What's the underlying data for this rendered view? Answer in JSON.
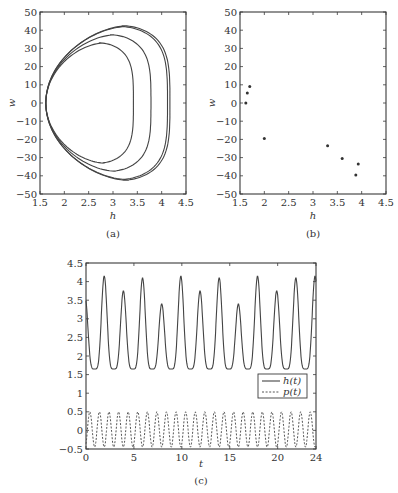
{
  "chart_data": [
    {
      "id": "a",
      "type": "line",
      "title": "",
      "caption": "(a)",
      "xlabel": "h",
      "ylabel": "w",
      "xlim": [
        1.5,
        4.5
      ],
      "ylim": [
        -50,
        50
      ],
      "xticks": [
        "1.5",
        "2",
        "2.5",
        "3",
        "3.5",
        "4",
        "4.5"
      ],
      "yticks": [
        "50",
        "40",
        "30",
        "20",
        "10",
        "0",
        "−10",
        "−20",
        "−30",
        "−40",
        "−50"
      ],
      "grid": false,
      "series": [
        {
          "name": "orbit-1",
          "h_min": 1.62,
          "h_max": 3.42,
          "w_max": 33,
          "w_min": -33,
          "h_at_wmax": 2.95
        },
        {
          "name": "orbit-2",
          "h_min": 1.62,
          "h_max": 3.78,
          "w_max": 37.5,
          "w_min": -37.5,
          "h_at_wmax": 3.3
        },
        {
          "name": "orbit-3",
          "h_min": 1.62,
          "h_max": 4.12,
          "w_max": 42,
          "w_min": -42,
          "h_at_wmax": 3.55
        },
        {
          "name": "orbit-4",
          "h_min": 1.62,
          "h_max": 4.17,
          "w_max": 42.5,
          "w_min": -42.5,
          "h_at_wmax": 3.6
        }
      ]
    },
    {
      "id": "b",
      "type": "scatter",
      "title": "",
      "caption": "(b)",
      "xlabel": "h",
      "ylabel": "w",
      "xlim": [
        1.5,
        4.5
      ],
      "ylim": [
        -50,
        50
      ],
      "xticks": [
        "1.5",
        "2",
        "2.5",
        "3",
        "3.5",
        "4",
        "4.5"
      ],
      "yticks": [
        "50",
        "40",
        "30",
        "20",
        "10",
        "0",
        "−10",
        "−20",
        "−30",
        "−40",
        "−50"
      ],
      "grid": false,
      "points": [
        {
          "x": 1.62,
          "y": 0
        },
        {
          "x": 1.65,
          "y": 5.5
        },
        {
          "x": 1.7,
          "y": 9
        },
        {
          "x": 2.0,
          "y": -19.5
        },
        {
          "x": 3.3,
          "y": -23.5
        },
        {
          "x": 3.6,
          "y": -30.5
        },
        {
          "x": 3.88,
          "y": -39.5
        },
        {
          "x": 3.93,
          "y": -33.5
        }
      ]
    },
    {
      "id": "c",
      "type": "line",
      "title": "",
      "caption": "(c)",
      "xlabel": "t",
      "ylabel": "",
      "xlim": [
        0,
        24
      ],
      "ylim": [
        -0.5,
        4.5
      ],
      "xticks": [
        "0",
        "5",
        "10",
        "15",
        "20",
        "24"
      ],
      "yticks": [
        "4.5",
        "4",
        "3.5",
        "3",
        "2.5",
        "2",
        "1.5",
        "1",
        "0.5",
        "0",
        "−0.5"
      ],
      "grid": false,
      "legend": {
        "position": "right-middle",
        "entries": [
          "h(t)",
          "p(t)"
        ]
      },
      "series": [
        {
          "name": "h(t)",
          "style": "solid",
          "start_value": 3.1,
          "trough": 1.65,
          "peak_times": [
            1.9,
            3.9,
            5.9,
            7.9,
            9.9,
            11.9,
            13.9,
            15.9,
            17.9,
            19.9,
            21.9
          ],
          "peak_values": [
            4.15,
            3.75,
            4.1,
            3.4,
            4.15,
            3.75,
            4.1,
            3.4,
            4.15,
            3.75,
            4.1
          ],
          "end_value": 3.5
        },
        {
          "name": "p(t)",
          "style": "dashed",
          "min": -0.45,
          "max": 0.5,
          "period": 1.0
        }
      ]
    }
  ]
}
